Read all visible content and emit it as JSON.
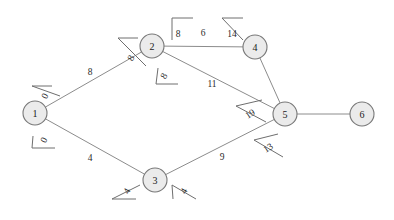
{
  "diagram": {
    "background_color": "#ffffff",
    "node_fill": "#ebebeb",
    "node_stroke": "#787878",
    "edge_stroke": "#8c8c8c",
    "nodes": [
      {
        "id": "1",
        "label": "1",
        "x": 35,
        "y": 113,
        "r": 12
      },
      {
        "id": "2",
        "label": "2",
        "x": 152,
        "y": 46,
        "r": 12
      },
      {
        "id": "3",
        "label": "3",
        "x": 155,
        "y": 180,
        "r": 12
      },
      {
        "id": "4",
        "label": "4",
        "x": 255,
        "y": 47,
        "r": 12
      },
      {
        "id": "5",
        "label": "5",
        "x": 285,
        "y": 114,
        "r": 12
      },
      {
        "id": "6",
        "label": "6",
        "x": 362,
        "y": 114,
        "r": 12
      }
    ],
    "edges": [
      {
        "from": "1",
        "to": "2",
        "weight": "8",
        "wx": 90,
        "wy": 72
      },
      {
        "from": "1",
        "to": "3",
        "weight": "4",
        "wx": 90,
        "wy": 158
      },
      {
        "from": "2",
        "to": "4",
        "weight": "6",
        "wx": 203,
        "wy": 33
      },
      {
        "from": "2",
        "to": "5",
        "weight": "11",
        "wx": 212,
        "wy": 84
      },
      {
        "from": "3",
        "to": "5",
        "weight": "9",
        "wx": 222,
        "wy": 157
      },
      {
        "from": "4",
        "to": "5",
        "weight": "",
        "wx": 276,
        "wy": 80
      },
      {
        "from": "5",
        "to": "6",
        "weight": "",
        "wx": 323,
        "wy": 114
      }
    ],
    "distance_labels": [
      {
        "text": "0",
        "x": 45,
        "y": 96,
        "rotate": -62,
        "at_node": "1",
        "toward": "2"
      },
      {
        "text": "0",
        "x": 44,
        "y": 140,
        "rotate": -62,
        "at_node": "1",
        "toward": "3"
      },
      {
        "text": "8",
        "x": 131,
        "y": 58,
        "rotate": -62,
        "at_node": "2",
        "toward": "1"
      },
      {
        "text": "8",
        "x": 164,
        "y": 76,
        "rotate": -62,
        "at_node": "2",
        "toward": "5"
      },
      {
        "text": "8",
        "x": 178,
        "y": 34,
        "rotate": 0,
        "at_node": "2",
        "toward": "4"
      },
      {
        "text": "14",
        "x": 232,
        "y": 34,
        "rotate": 0,
        "at_node": "4",
        "toward": "2"
      },
      {
        "text": "4",
        "x": 127,
        "y": 191,
        "rotate": -62,
        "at_node": "3",
        "toward": "1"
      },
      {
        "text": "4",
        "x": 184,
        "y": 191,
        "rotate": -62,
        "at_node": "3",
        "toward": "5"
      },
      {
        "text": "19",
        "x": 250,
        "y": 114,
        "rotate": -33,
        "at_node": "5",
        "toward": "2"
      },
      {
        "text": "13",
        "x": 268,
        "y": 148,
        "rotate": -33,
        "at_node": "5",
        "toward": "3"
      }
    ],
    "bracket_marks": [
      {
        "name": "tick-node1-to-node2",
        "x1": 32,
        "y1": 86,
        "x2": 52,
        "y2": 86,
        "x3": 60,
        "y3": 96
      },
      {
        "name": "tick-node1-to-node3",
        "x1": 32,
        "y1": 148,
        "x2": 55,
        "y2": 148,
        "x3": 33,
        "y3": 136
      },
      {
        "name": "tick-node2-to-node1",
        "x1": 118,
        "y1": 38,
        "x2": 138,
        "y2": 38,
        "x3": 146,
        "y3": 66
      },
      {
        "name": "tick-node2-to-node5",
        "x1": 156,
        "y1": 84,
        "x2": 178,
        "y2": 84,
        "x3": 158,
        "y3": 68
      },
      {
        "name": "bracket-node2-top",
        "x1": 172,
        "y1": 18,
        "x2": 193,
        "y2": 18,
        "x3": 172,
        "y3": 40
      },
      {
        "name": "bracket-node4-top",
        "x1": 222,
        "y1": 18,
        "x2": 243,
        "y2": 18,
        "x3": 243,
        "y3": 40
      },
      {
        "name": "tick-node3-to-node1",
        "x1": 112,
        "y1": 199,
        "x2": 136,
        "y2": 199,
        "x3": 140,
        "y3": 185
      },
      {
        "name": "tick-node3-to-node5",
        "x1": 172,
        "y1": 185,
        "x2": 196,
        "y2": 199,
        "x3": 173,
        "y3": 199
      },
      {
        "name": "tick-node5-to-node2",
        "x1": 236,
        "y1": 106,
        "x2": 262,
        "y2": 100,
        "x3": 266,
        "y3": 122
      },
      {
        "name": "tick-node5-to-node3",
        "x1": 254,
        "y1": 140,
        "x2": 278,
        "y2": 134,
        "x3": 283,
        "y3": 157
      }
    ]
  }
}
